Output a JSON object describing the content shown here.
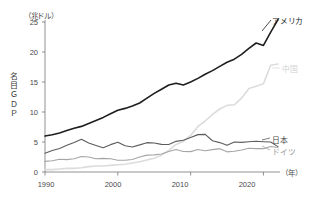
{
  "chart_data": {
    "type": "line",
    "title": "",
    "ylabel": "名目ＧＤＰ",
    "yunit": "（兆ドル）",
    "xlabel": "",
    "xunit": "（年）",
    "ylim": [
      0,
      25
    ],
    "xlim": [
      1990,
      2022
    ],
    "grid": false,
    "legend_position": "right-inline",
    "yticks": [
      "25",
      "20",
      "15",
      "10",
      "5",
      "0"
    ],
    "ytick_values": [
      25,
      20,
      15,
      10,
      5,
      0
    ],
    "xticks": [
      "1990",
      "2000",
      "2010",
      "2020"
    ],
    "xtick_values": [
      1990,
      2000,
      2010,
      2020
    ],
    "x": [
      1990,
      1991,
      1992,
      1993,
      1994,
      1995,
      1996,
      1997,
      1998,
      1999,
      2000,
      2001,
      2002,
      2003,
      2004,
      2005,
      2006,
      2007,
      2008,
      2009,
      2010,
      2011,
      2012,
      2013,
      2014,
      2015,
      2016,
      2017,
      2018,
      2019,
      2020,
      2021,
      2022
    ],
    "series": [
      {
        "name": "アメリカ",
        "color": "#1e1e1e",
        "width": 1.6,
        "values": [
          6.0,
          6.2,
          6.5,
          6.9,
          7.3,
          7.6,
          8.1,
          8.6,
          9.1,
          9.7,
          10.3,
          10.6,
          11.0,
          11.5,
          12.3,
          13.1,
          13.8,
          14.5,
          14.8,
          14.5,
          15.0,
          15.6,
          16.3,
          16.9,
          17.6,
          18.3,
          18.8,
          19.6,
          20.6,
          21.5,
          21.1,
          23.3,
          25.4
        ]
      },
      {
        "name": "中国",
        "color": "#dcdcdc",
        "width": 1.6,
        "values": [
          0.4,
          0.4,
          0.5,
          0.6,
          0.6,
          0.7,
          0.9,
          1.0,
          1.0,
          1.1,
          1.2,
          1.3,
          1.5,
          1.7,
          2.0,
          2.3,
          2.8,
          3.6,
          4.6,
          5.1,
          6.1,
          7.6,
          8.5,
          9.6,
          10.5,
          11.1,
          11.2,
          12.3,
          13.9,
          14.3,
          14.7,
          17.8,
          18.0
        ]
      },
      {
        "name": "日本",
        "color": "#5c5c5c",
        "width": 1.1,
        "values": [
          3.13,
          3.58,
          3.91,
          4.45,
          4.91,
          5.45,
          4.83,
          4.42,
          4.03,
          4.56,
          4.97,
          4.37,
          4.18,
          4.52,
          4.89,
          4.83,
          4.6,
          4.58,
          5.11,
          5.29,
          5.76,
          6.23,
          6.27,
          5.21,
          4.9,
          4.44,
          5.0,
          4.93,
          5.04,
          5.12,
          5.05,
          5.0,
          4.23
        ]
      },
      {
        "name": "ドイツ",
        "color": "#a5a5a5",
        "width": 1.1,
        "values": [
          1.77,
          1.87,
          2.13,
          2.07,
          2.21,
          2.59,
          2.5,
          2.22,
          2.27,
          2.2,
          1.95,
          1.95,
          2.08,
          2.5,
          2.81,
          2.85,
          2.99,
          3.43,
          3.75,
          3.42,
          3.4,
          3.75,
          3.53,
          3.73,
          3.89,
          3.36,
          3.47,
          3.68,
          3.97,
          3.89,
          3.89,
          4.26,
          4.08
        ]
      }
    ],
    "annotations": [
      {
        "name": "america",
        "text": "アメリカ"
      },
      {
        "name": "china",
        "text": "中国"
      },
      {
        "name": "japan",
        "text": "日本"
      },
      {
        "name": "germany",
        "text": "ドイツ"
      }
    ]
  },
  "axis": {
    "yunit_label": "（兆ドル）",
    "xunit_label": "（年）",
    "yaxis_title_chars": [
      "名",
      "目",
      "Ｇ",
      "Ｄ",
      "Ｐ"
    ]
  }
}
